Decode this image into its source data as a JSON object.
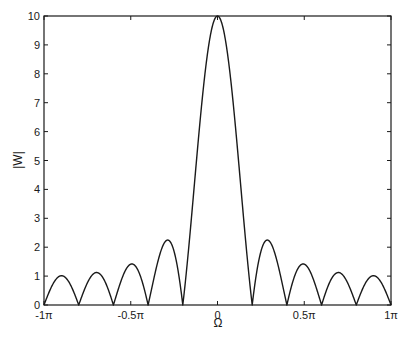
{
  "chart_data": {
    "type": "line",
    "title": "",
    "xlabel": "Ω",
    "ylabel": "|W|",
    "xlim": [
      -1,
      1
    ],
    "xlim_units": "π",
    "ylim": [
      0,
      10
    ],
    "grid": false,
    "legend": null,
    "x_ticks": [
      {
        "value": -1,
        "label": "-1π"
      },
      {
        "value": -0.5,
        "label": "-0.5π"
      },
      {
        "value": 0,
        "label": "0"
      },
      {
        "value": 0.5,
        "label": "0.5π"
      },
      {
        "value": 1,
        "label": "1π"
      }
    ],
    "y_ticks": [
      0,
      1,
      2,
      3,
      4,
      5,
      6,
      7,
      8,
      9,
      10
    ],
    "series": [
      {
        "name": "|W(Ω)|",
        "description": "Magnitude of rectangular window spectrum (Dirichlet kernel), N = 10",
        "window_length": 10,
        "color": "#1a1a1a",
        "x": [
          -1.0,
          -0.9,
          -0.8,
          -0.7,
          -0.6,
          -0.5,
          -0.4,
          -0.3,
          -0.2,
          -0.1,
          0.0,
          0.1,
          0.2,
          0.3,
          0.4,
          0.5,
          0.6,
          0.7,
          0.8,
          0.9,
          1.0
        ],
        "values": [
          0.0,
          1.01,
          0.0,
          1.12,
          0.0,
          1.41,
          0.0,
          2.26,
          0.0,
          6.47,
          10.0,
          6.47,
          0.0,
          2.26,
          0.0,
          1.41,
          0.0,
          1.12,
          0.0,
          1.01,
          0.0
        ]
      }
    ],
    "nulls": [
      -1.0,
      -0.8,
      -0.6,
      -0.4,
      -0.2,
      0.2,
      0.4,
      0.6,
      0.8,
      1.0
    ],
    "sidelobe_peaks": [
      {
        "x": -0.9,
        "y": 1.01
      },
      {
        "x": -0.7,
        "y": 1.12
      },
      {
        "x": -0.5,
        "y": 1.41
      },
      {
        "x": -0.3,
        "y": 2.26
      },
      {
        "x": 0.3,
        "y": 2.26
      },
      {
        "x": 0.5,
        "y": 1.41
      },
      {
        "x": 0.7,
        "y": 1.12
      },
      {
        "x": 0.9,
        "y": 1.01
      }
    ],
    "main_lobe_peak": {
      "x": 0,
      "y": 10
    }
  },
  "plot": {
    "ylabel": "|W|",
    "xlabel": "Ω"
  }
}
